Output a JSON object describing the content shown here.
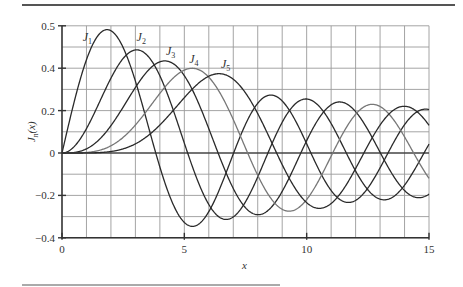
{
  "chart_data": {
    "type": "line",
    "title": "",
    "xlabel": "x",
    "ylabel": "J_n(x)",
    "xlim": [
      0,
      15
    ],
    "ylim": [
      -0.4,
      0.6
    ],
    "grid": true,
    "x_ticks": [
      {
        "value": 0,
        "label": "0"
      },
      {
        "value": 5,
        "label": "5"
      },
      {
        "value": 10,
        "label": "10"
      },
      {
        "value": 15,
        "label": "15"
      }
    ],
    "y_ticks": [
      {
        "value": 0.6,
        "label": "0.5"
      },
      {
        "value": 0.4,
        "label": "0.4"
      },
      {
        "value": 0.2,
        "label": "0.2"
      },
      {
        "value": 0,
        "label": "0"
      },
      {
        "value": -0.2,
        "label": "−0.2"
      },
      {
        "value": -0.4,
        "label": "−0.4"
      }
    ],
    "grid_x_step": 1,
    "grid_y_step": 0.1,
    "series": [
      {
        "name": "J1",
        "order": 1,
        "label_main": "J",
        "label_sub": "1",
        "label_pos": [
          0.85,
          0.53
        ],
        "color": "#2a2a2a",
        "peak": [
          1.84,
          0.58
        ]
      },
      {
        "name": "J2",
        "order": 2,
        "label_main": "J",
        "label_sub": "2",
        "label_pos": [
          3.05,
          0.53
        ],
        "color": "#2a2a2a",
        "peak": [
          3.05,
          0.49
        ]
      },
      {
        "name": "J3",
        "order": 3,
        "label_main": "J",
        "label_sub": "3",
        "label_pos": [
          4.25,
          0.46
        ],
        "color": "#2a2a2a",
        "peak": [
          4.2,
          0.43
        ]
      },
      {
        "name": "J4",
        "order": 4,
        "label_main": "J",
        "label_sub": "4",
        "label_pos": [
          5.2,
          0.425
        ],
        "color": "#777777",
        "peak": [
          5.32,
          0.4
        ]
      },
      {
        "name": "J5",
        "order": 5,
        "label_main": "J",
        "label_sub": "5",
        "label_pos": [
          6.5,
          0.4
        ],
        "color": "#2a2a2a",
        "peak": [
          6.42,
          0.37
        ]
      }
    ]
  }
}
